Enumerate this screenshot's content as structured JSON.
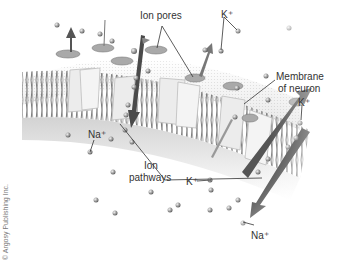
{
  "diagram": {
    "labels": {
      "ion_pores": "Ion pores",
      "k_top": "K⁺",
      "membrane": "Membrane",
      "of_neuron": "of neuron",
      "k_right": "K⁺",
      "na_left": "Na⁺",
      "ion": "Ion",
      "pathways": "pathways",
      "k_bottom": "K⁺",
      "na_bottom": "Na⁺"
    },
    "copyright": "© Argosy Publishing Inc.",
    "colors": {
      "membrane_band": "#c8c8c8",
      "lipid": "#6e6e6e",
      "channel": "#e6e6e6",
      "pore": "#8a8a8a",
      "ion": "#9a9a9a",
      "arrow": "#4a4a4a",
      "label_line": "#333333"
    }
  }
}
